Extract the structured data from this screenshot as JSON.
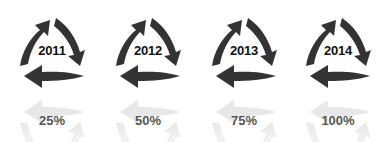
{
  "items": [
    {
      "year": "2011",
      "percent": "25%"
    },
    {
      "year": "2012",
      "percent": "50%"
    },
    {
      "year": "2013",
      "percent": "75%"
    },
    {
      "year": "2014",
      "percent": "100%"
    }
  ],
  "colors": {
    "arrow": "#333333",
    "reflection": "#d6d6d6",
    "year_text": "#111111",
    "percent_text": "#555555"
  },
  "icon": "cycle-three-arrows-icon"
}
